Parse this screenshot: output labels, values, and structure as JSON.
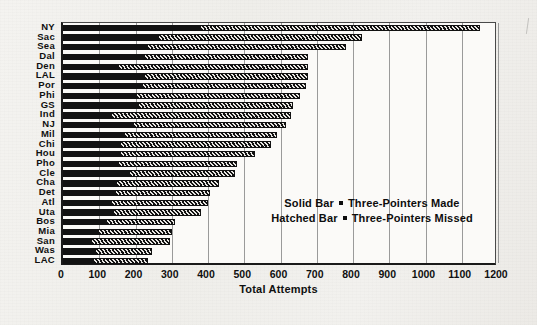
{
  "chart_data": {
    "type": "bar",
    "orientation": "horizontal",
    "stacked": true,
    "title": "",
    "xlabel": "Total Attempts",
    "ylabel": "",
    "xlim": [
      0,
      1200
    ],
    "xticks": [
      0,
      100,
      200,
      300,
      400,
      500,
      600,
      700,
      800,
      900,
      1000,
      1100,
      1200
    ],
    "xtick_labels": [
      "0",
      "100",
      "200",
      "300",
      "400",
      "500",
      "600",
      "700",
      "800",
      "900",
      "1000",
      "1100",
      "1200"
    ],
    "grid": "vertical",
    "legend_position": "inside-right",
    "categories": [
      "NY",
      "Sac",
      "Sea",
      "Dal",
      "Den",
      "LAL",
      "Por",
      "Phi",
      "GS",
      "Ind",
      "NJ",
      "Mil",
      "Chi",
      "Hou",
      "Pho",
      "Cle",
      "Cha",
      "Det",
      "Atl",
      "Uta",
      "Bos",
      "Mia",
      "San",
      "Was",
      "LAC"
    ],
    "series": [
      {
        "name": "Three-Pointers Made",
        "style": "solid",
        "color": "#121212",
        "values": [
          380,
          265,
          235,
          225,
          155,
          225,
          220,
          205,
          210,
          135,
          195,
          170,
          160,
          160,
          155,
          185,
          150,
          145,
          135,
          140,
          120,
          100,
          80,
          90,
          85
        ]
      },
      {
        "name": "Three-Pointers Missed",
        "style": "hatched",
        "color": "#111111",
        "values": [
          770,
          560,
          545,
          450,
          520,
          450,
          450,
          450,
          425,
          495,
          420,
          420,
          415,
          370,
          325,
          290,
          280,
          260,
          265,
          240,
          190,
          200,
          215,
          155,
          150
        ]
      }
    ],
    "totals": [
      1150,
      825,
      780,
      675,
      675,
      675,
      670,
      655,
      635,
      630,
      615,
      590,
      575,
      530,
      480,
      475,
      430,
      405,
      400,
      380,
      310,
      300,
      295,
      245,
      235
    ]
  },
  "legend": {
    "line1_left": "Solid Bar",
    "line1_right": "Three-Pointers Made",
    "line2_left": "Hatched Bar",
    "line2_right": "Three-Pointers Missed"
  }
}
